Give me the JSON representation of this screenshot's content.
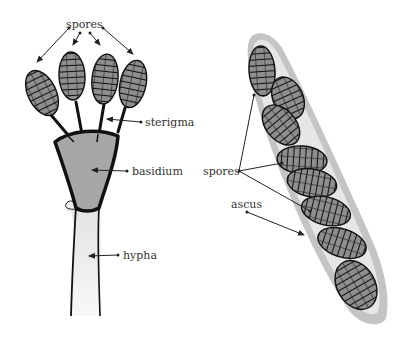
{
  "left_diagram": {
    "structure": "basidium",
    "labels": {
      "spores": "spores",
      "sterigma": "sterigma",
      "basidium": "basidium",
      "hypha": "hypha"
    }
  },
  "right_diagram": {
    "structure": "ascus",
    "labels": {
      "spores": "spores",
      "ascus": "ascus"
    }
  },
  "colors": {
    "spore_fill": "#8c8c8c",
    "basidium_fill": "#a6a6a6",
    "hypha_fill": "#ececec",
    "ascus_outer": "#c4c4c4",
    "ascus_inner": "#e4e4e4",
    "outline": "#111111",
    "label_text": "#333333"
  }
}
